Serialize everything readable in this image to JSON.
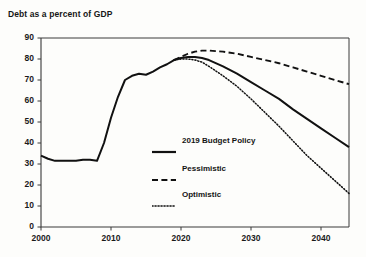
{
  "chart_data": {
    "type": "line",
    "title": "Debt as a percent of GDP",
    "xlabel": "",
    "ylabel": "",
    "xlim": [
      2000,
      2044
    ],
    "ylim": [
      0,
      90
    ],
    "ytick_labels": [
      "0",
      "10",
      "20",
      "30",
      "40",
      "50",
      "60",
      "70",
      "80",
      "90"
    ],
    "yticks": [
      0,
      10,
      20,
      30,
      40,
      50,
      60,
      70,
      80,
      90
    ],
    "xtick_labels": [
      "2000",
      "2010",
      "2020",
      "2030",
      "2040"
    ],
    "xticks": [
      2000,
      2010,
      2020,
      2030,
      2040
    ],
    "grid": false,
    "legend_position": "center",
    "series": [
      {
        "name": "2019 Budget Policy",
        "style": "solid",
        "color": "#111111",
        "x": [
          2000,
          2001,
          2002,
          2003,
          2004,
          2005,
          2006,
          2007,
          2008,
          2009,
          2010,
          2011,
          2012,
          2013,
          2014,
          2015,
          2016,
          2017,
          2018,
          2019,
          2020,
          2021,
          2022,
          2023,
          2024,
          2026,
          2028,
          2030,
          2032,
          2034,
          2036,
          2038,
          2040,
          2042,
          2044
        ],
        "values": [
          34,
          32.5,
          31.5,
          31.5,
          31.5,
          31.5,
          32,
          32,
          31.5,
          40,
          52,
          62,
          70,
          72,
          73,
          72.5,
          74,
          76,
          77.5,
          79.5,
          80.5,
          81,
          81,
          80.5,
          79.5,
          76.5,
          73,
          69,
          65,
          61,
          56,
          51.5,
          47,
          42.5,
          38
        ]
      },
      {
        "name": "Pessimistic",
        "style": "dashed",
        "color": "#111111",
        "x": [
          2019,
          2020,
          2021,
          2022,
          2023,
          2024,
          2026,
          2028,
          2030,
          2032,
          2034,
          2036,
          2038,
          2040,
          2042,
          2044
        ],
        "values": [
          79.5,
          81,
          82.5,
          83.5,
          84,
          84,
          83.5,
          82.5,
          81,
          79.5,
          78,
          76,
          74,
          72,
          70,
          68
        ]
      },
      {
        "name": "Optimistic",
        "style": "dotted",
        "color": "#111111",
        "x": [
          2019,
          2020,
          2021,
          2022,
          2023,
          2024,
          2026,
          2028,
          2030,
          2032,
          2034,
          2036,
          2038,
          2040,
          2042,
          2044
        ],
        "values": [
          79.5,
          80,
          80,
          79.5,
          78.5,
          76.5,
          72,
          67,
          61,
          54.5,
          48,
          41,
          34,
          28,
          22,
          16
        ]
      }
    ]
  },
  "legend": {
    "items": [
      {
        "label": "2019 Budget Policy",
        "style": "solid"
      },
      {
        "label": "Pessimistic",
        "style": "dashed"
      },
      {
        "label": "Optimistic",
        "style": "dotted"
      }
    ]
  }
}
